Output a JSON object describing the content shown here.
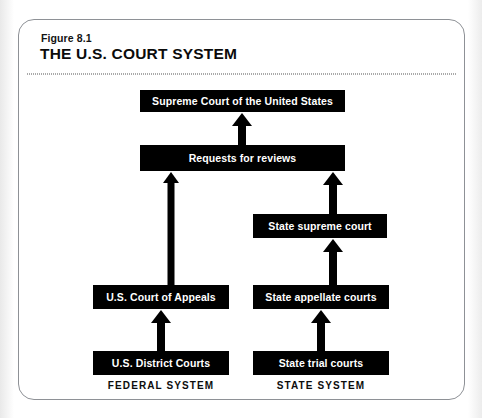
{
  "figure": {
    "number": "Figure 8.1",
    "title": "THE U.S. COURT SYSTEM"
  },
  "diagram": {
    "type": "flowchart",
    "orientation": "bottom-up",
    "node_fill_color": "#000000",
    "node_text_color": "#ffffff",
    "nodes": [
      {
        "id": "scotus",
        "label": "Supreme Court of the United States",
        "column": "shared",
        "level": 5
      },
      {
        "id": "requests",
        "label": "Requests for reviews",
        "column": "shared",
        "level": 4
      },
      {
        "id": "state_supreme",
        "label": "State supreme court",
        "column": "state",
        "level": 3
      },
      {
        "id": "fed_appeals",
        "label": "U.S. Court of Appeals",
        "column": "federal",
        "level": 2
      },
      {
        "id": "state_appeal",
        "label": "State appellate courts",
        "column": "state",
        "level": 2
      },
      {
        "id": "fed_district",
        "label": "U.S. District Courts",
        "column": "federal",
        "level": 1
      },
      {
        "id": "state_trial",
        "label": "State trial courts",
        "column": "state",
        "level": 1
      }
    ],
    "edges": [
      {
        "from": "requests",
        "to": "scotus",
        "style": "arrow-up"
      },
      {
        "from": "fed_appeals",
        "to": "requests",
        "style": "arrow-up"
      },
      {
        "from": "state_supreme",
        "to": "requests",
        "style": "arrow-up"
      },
      {
        "from": "state_appeal",
        "to": "state_supreme",
        "style": "arrow-up"
      },
      {
        "from": "fed_district",
        "to": "fed_appeals",
        "style": "arrow-up"
      },
      {
        "from": "state_trial",
        "to": "state_appeal",
        "style": "arrow-up"
      }
    ],
    "column_captions": {
      "federal": "FEDERAL SYSTEM",
      "state": "STATE SYSTEM"
    }
  }
}
